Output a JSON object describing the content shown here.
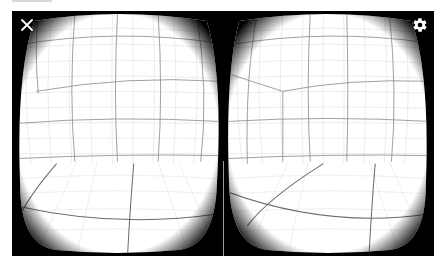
{
  "app": {
    "view": "Cardboard VR stereo view"
  },
  "controls": {
    "close_icon": "close-icon",
    "settings_icon": "gear-icon"
  },
  "colors": {
    "frame": "#000000",
    "lens_background": "#ffffff",
    "grid_major": "#7a7a7a",
    "grid_minor": "#d6d6d6",
    "icon": "#ffffff",
    "divider": "#9a9a9a"
  },
  "eyes": [
    {
      "id": "left",
      "content": "distorted grid room"
    },
    {
      "id": "right",
      "content": "distorted grid room"
    }
  ]
}
